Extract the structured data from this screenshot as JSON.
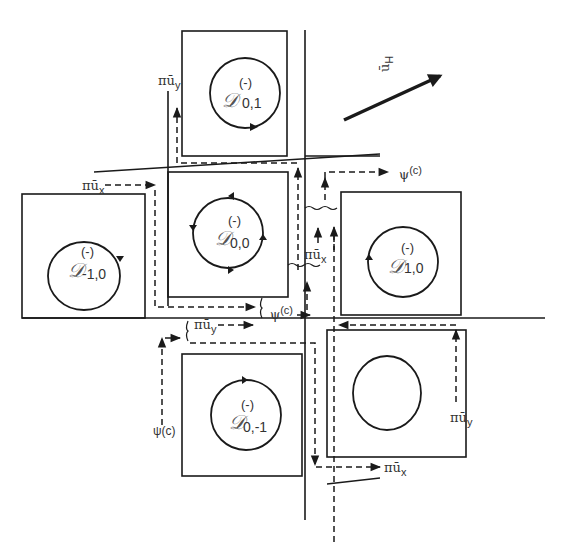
{
  "figure": {
    "vector_label": {
      "base": "ū",
      "sub": "H"
    },
    "domains": [
      {
        "id": "d01",
        "symbol": "𝒟",
        "sup": "(-)",
        "sub": "0,1"
      },
      {
        "id": "d00",
        "symbol": "𝒟",
        "sup": "(-)",
        "sub": "0,0"
      },
      {
        "id": "dm10",
        "symbol": "𝒟",
        "sup": "(-)",
        "sub": "-1,0"
      },
      {
        "id": "d10",
        "symbol": "𝒟",
        "sup": "(-)",
        "sub": "1,0"
      },
      {
        "id": "d0m1",
        "symbol": "𝒟",
        "sup": "(-)",
        "sub": "0,-1"
      }
    ],
    "flux_labels": {
      "pi_uy_top": {
        "pi": "π",
        "base": "ū",
        "sub": "y"
      },
      "pi_ux_left": {
        "pi": "π",
        "base": "ū",
        "sub": "x"
      },
      "psi_c_top": {
        "base": "ψ",
        "sup": "(c)"
      },
      "pi_ux_center": {
        "pi": "π",
        "base": "ū",
        "sub": "x"
      },
      "psi_c_center": {
        "base": "ψ",
        "sup": "(c)"
      },
      "pi_uy_center": {
        "pi": "π",
        "base": "ū",
        "sub": "y"
      },
      "psi_c_bottom": {
        "text": "ψ(c)"
      },
      "pi_uy_right": {
        "pi": "π",
        "base": "ū",
        "sub": "y"
      },
      "pi_ux_bottom": {
        "pi": "π",
        "base": "ū",
        "sub": "x"
      }
    }
  }
}
